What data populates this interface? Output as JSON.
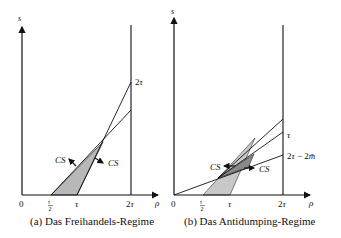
{
  "panels": [
    {
      "id": "a",
      "caption": "(a) Das Freihandels-Regime",
      "y_axis_label": "s",
      "x_axis_label": "ρ",
      "origin_label": "0",
      "x_ticks": [
        "τ/2",
        "τ",
        "2τ"
      ],
      "right_labels": [
        "2τ"
      ],
      "cs_labels": [
        "CS",
        "CS"
      ],
      "colors": {
        "shade": "#b8b8b8",
        "line": "#1a1a1a"
      }
    },
    {
      "id": "b",
      "caption": "(b) Das Antidumping-Regime",
      "y_axis_label": "s",
      "x_axis_label": "ρ",
      "origin_label": "0",
      "x_ticks": [
        "τ/2",
        "τ",
        "2τ"
      ],
      "right_labels": [
        "τ",
        "2τ − 2m̄"
      ],
      "cs_labels": [
        "CS",
        "CS"
      ],
      "colors": {
        "shade_light": "#c8c8c8",
        "shade_dark": "#808080",
        "line": "#1a1a1a"
      }
    }
  ]
}
